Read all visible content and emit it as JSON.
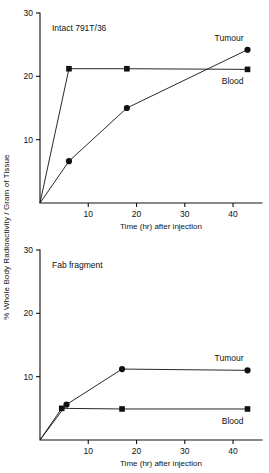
{
  "figure": {
    "y_axis_title": "% Whole Body Radioactivity / Gram of Tissue"
  },
  "chart_data": [
    {
      "type": "line",
      "title": "Intact 791T/36",
      "xlabel": "Time (hr) after injection",
      "ylabel": "% Whole Body Radioactivity / Gram of Tissue",
      "xlim": [
        0,
        46
      ],
      "ylim": [
        0,
        30
      ],
      "xticks": [
        10,
        20,
        30,
        40
      ],
      "yticks": [
        10,
        20,
        30
      ],
      "grid": false,
      "legend": "inline-right",
      "series": [
        {
          "name": "Tumour",
          "marker": "circle",
          "x": [
            0,
            6,
            18,
            43
          ],
          "y": [
            0,
            6.6,
            15.0,
            24.2
          ]
        },
        {
          "name": "Blood",
          "marker": "square",
          "x": [
            0,
            6,
            18,
            43
          ],
          "y": [
            0,
            21.2,
            21.2,
            21.1
          ]
        }
      ]
    },
    {
      "type": "line",
      "title": "Fab fragment",
      "xlabel": "Time (hr) after injection",
      "ylabel": "% Whole Body Radioactivity / Gram of Tissue",
      "xlim": [
        0,
        46
      ],
      "ylim": [
        0,
        30
      ],
      "xticks": [
        10,
        20,
        30,
        40
      ],
      "yticks": [
        10,
        20,
        30
      ],
      "grid": false,
      "legend": "inline-right",
      "series": [
        {
          "name": "Tumour",
          "marker": "circle",
          "x": [
            0,
            5.5,
            17,
            43
          ],
          "y": [
            0,
            5.6,
            11.2,
            11.0
          ]
        },
        {
          "name": "Blood",
          "marker": "square",
          "x": [
            0,
            4.5,
            17,
            43
          ],
          "y": [
            0,
            5.0,
            4.9,
            4.9
          ]
        }
      ]
    }
  ]
}
